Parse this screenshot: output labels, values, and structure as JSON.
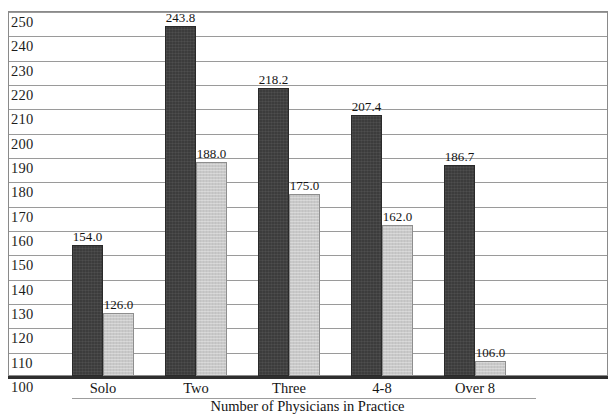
{
  "chart_data": {
    "type": "bar",
    "title": "",
    "xlabel": "Number of Physicians in Practice",
    "ylabel": "",
    "categories": [
      "Solo",
      "Two",
      "Three",
      "4-8",
      "Over 8"
    ],
    "series": [
      {
        "name": "series-dark",
        "color": "#3c3c3c",
        "values": [
          154.0,
          243.8,
          218.2,
          207.4,
          186.7
        ],
        "labels": [
          "154.0",
          "243.8",
          "218.2",
          "207.4",
          "186.7"
        ]
      },
      {
        "name": "series-light",
        "color": "#c9c9c9",
        "values": [
          126.0,
          188.0,
          175.0,
          162.0,
          106.0
        ],
        "labels": [
          "126.0",
          "188.0",
          "175.0",
          "162.0",
          "106.0"
        ]
      }
    ],
    "ylim": [
      100,
      250
    ],
    "ytick_step": 10,
    "yticks": [
      100,
      110,
      120,
      130,
      140,
      150,
      160,
      170,
      180,
      190,
      200,
      210,
      220,
      230,
      240,
      250
    ],
    "ytick_labels": [
      "100",
      "110",
      "120",
      "130",
      "140",
      "150",
      "160",
      "170",
      "180",
      "190",
      "200",
      "210",
      "220",
      "230",
      "240",
      "250"
    ],
    "grid": true,
    "legend": "none",
    "frame_color": "#8a8a8a",
    "grid_color": "#9a9a9a",
    "axis_color": "#2e2e2e",
    "background": "#ffffff"
  }
}
